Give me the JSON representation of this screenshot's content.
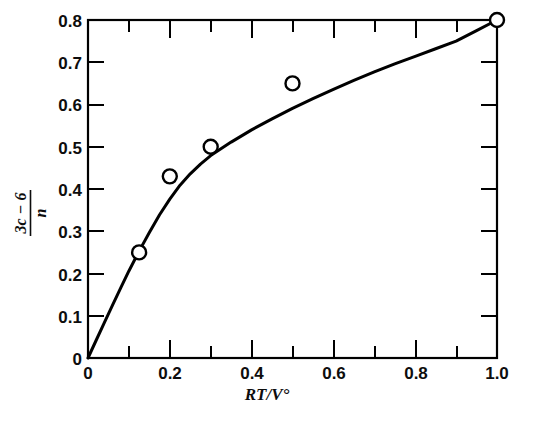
{
  "chart_data": {
    "type": "line",
    "title": "",
    "xlabel": "RT/V°",
    "ylabel_numerator": "3c − 6",
    "ylabel_denominator": "n",
    "xlim": [
      0,
      1.0
    ],
    "ylim": [
      0,
      0.8
    ],
    "grid": false,
    "legend": "none",
    "frame": "box",
    "tick_direction": "in",
    "x_major_ticks": [
      0,
      0.2,
      0.4,
      0.6,
      0.8,
      1.0
    ],
    "x_minor_ticks": [
      0.1,
      0.3,
      0.5,
      0.7,
      0.9
    ],
    "x_tick_labels": [
      "0",
      "0.2",
      "0.4",
      "0.6",
      "0.8",
      "1.0"
    ],
    "y_major_ticks": [
      0,
      0.1,
      0.2,
      0.3,
      0.4,
      0.5,
      0.6,
      0.7,
      0.8
    ],
    "y_tick_labels": [
      "0",
      "0.1",
      "0.2",
      "0.3",
      "0.4",
      "0.5",
      "0.6",
      "0.7",
      "0.8"
    ],
    "series": [
      {
        "name": "fitted-curve",
        "marker": "none",
        "line": "solid",
        "color": "#000000",
        "x": [
          0.0,
          0.02,
          0.04,
          0.06,
          0.08,
          0.1,
          0.125,
          0.15,
          0.175,
          0.2,
          0.225,
          0.25,
          0.275,
          0.3,
          0.35,
          0.4,
          0.45,
          0.5,
          0.55,
          0.6,
          0.65,
          0.7,
          0.75,
          0.8,
          0.85,
          0.9,
          0.95,
          1.0
        ],
        "y": [
          0.0,
          0.042,
          0.084,
          0.125,
          0.166,
          0.206,
          0.253,
          0.297,
          0.339,
          0.376,
          0.409,
          0.436,
          0.459,
          0.479,
          0.511,
          0.54,
          0.566,
          0.591,
          0.614,
          0.636,
          0.657,
          0.677,
          0.696,
          0.714,
          0.732,
          0.75,
          0.775,
          0.8
        ]
      },
      {
        "name": "measured-points",
        "marker": "open-circle",
        "line": "none",
        "color": "#000000",
        "points": [
          {
            "x": 0.125,
            "y": 0.25
          },
          {
            "x": 0.2,
            "y": 0.43
          },
          {
            "x": 0.3,
            "y": 0.5
          },
          {
            "x": 0.5,
            "y": 0.65
          },
          {
            "x": 1.0,
            "y": 0.8
          }
        ]
      }
    ]
  },
  "caption": {
    "clipped_text": ""
  }
}
